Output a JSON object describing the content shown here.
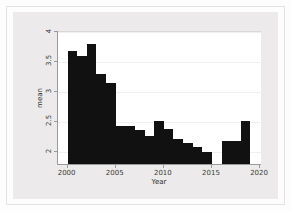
{
  "chart_data": {
    "type": "bar",
    "title": "",
    "xlabel": "Year",
    "ylabel": "mean",
    "xlim": [
      1999.0,
      2020.2
    ],
    "ylim": [
      1.78,
      4.0
    ],
    "grid": true,
    "legend": "none",
    "bar_color": "#111111",
    "panel_color": "#eceaea",
    "plot_background": "#ffffff",
    "axis_color": "#9a9a9a",
    "x_ticks": [
      2000,
      2005,
      2010,
      2015,
      2020
    ],
    "x_tick_labels": [
      "2000",
      "2005",
      "2010",
      "2015",
      "2020"
    ],
    "y_ticks": [
      2,
      2.5,
      3,
      3.5,
      4
    ],
    "y_tick_labels": [
      "2",
      "2.5",
      "3",
      "3.5",
      "4"
    ],
    "note": "y-axis is truncated; bars are drawn from the bottom of the panel",
    "categories": [
      2000,
      2001,
      2002,
      2003,
      2004,
      2005,
      2006,
      2007,
      2008,
      2009,
      2010,
      2011,
      2012,
      2013,
      2014,
      2016,
      2017,
      2018
    ],
    "values": [
      3.66,
      3.58,
      3.78,
      3.29,
      3.13,
      2.42,
      2.42,
      2.34,
      2.25,
      2.5,
      2.37,
      2.19,
      2.13,
      2.06,
      1.98,
      2.17,
      2.17,
      2.5
    ],
    "missing_years": [
      2015,
      2019
    ],
    "bars": [
      {
        "year": 2000,
        "value": 3.66
      },
      {
        "year": 2001,
        "value": 3.58
      },
      {
        "year": 2002,
        "value": 3.78
      },
      {
        "year": 2003,
        "value": 3.29
      },
      {
        "year": 2004,
        "value": 3.13
      },
      {
        "year": 2005,
        "value": 2.42
      },
      {
        "year": 2006,
        "value": 2.42
      },
      {
        "year": 2007,
        "value": 2.34
      },
      {
        "year": 2008,
        "value": 2.25
      },
      {
        "year": 2009,
        "value": 2.5
      },
      {
        "year": 2010,
        "value": 2.37
      },
      {
        "year": 2011,
        "value": 2.19
      },
      {
        "year": 2012,
        "value": 2.13
      },
      {
        "year": 2013,
        "value": 2.06
      },
      {
        "year": 2014,
        "value": 1.98
      },
      {
        "year": 2016,
        "value": 2.17
      },
      {
        "year": 2017,
        "value": 2.17
      },
      {
        "year": 2018,
        "value": 2.5
      }
    ]
  }
}
